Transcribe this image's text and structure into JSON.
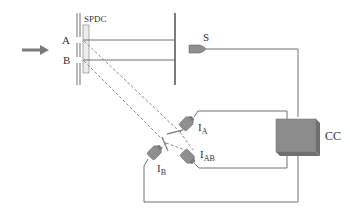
{
  "diagram": {
    "colors": {
      "line": "#707070",
      "barrier": "#8a8a8a",
      "crystal_fill": "#ececec",
      "detector_fill": "#8f8f8f",
      "cc_fill": "#8c8c8c",
      "cc_side": "#6e6e6e",
      "arrow": "#7a7a7a",
      "text": "#333333"
    },
    "labels": {
      "spdc": "SPDC",
      "path_a": "A",
      "path_b": "B",
      "detector_s": "S",
      "detector_ia_main": "I",
      "detector_ia_sub": "A",
      "detector_ib_main": "I",
      "detector_ib_sub": "B",
      "detector_iab_main": "I",
      "detector_iab_sub": "AB",
      "coincidence_counter": "CC"
    },
    "components": [
      {
        "id": "pump-arrow",
        "type": "arrow"
      },
      {
        "id": "double-slit-barrier",
        "type": "barrier",
        "slits": [
          "A",
          "B"
        ]
      },
      {
        "id": "spdc-crystal",
        "type": "crystal",
        "label": "SPDC"
      },
      {
        "id": "screen-wall",
        "type": "wall"
      },
      {
        "id": "detector-s",
        "type": "detector",
        "label": "S"
      },
      {
        "id": "beam-splitter-1",
        "type": "beam-splitter"
      },
      {
        "id": "beam-splitter-2",
        "type": "beam-splitter"
      },
      {
        "id": "detector-ia",
        "type": "detector",
        "label": "IA"
      },
      {
        "id": "detector-ib",
        "type": "detector",
        "label": "IB"
      },
      {
        "id": "detector-iab",
        "type": "detector",
        "label": "IAB"
      },
      {
        "id": "coincidence-counter",
        "type": "box",
        "label": "CC"
      }
    ]
  }
}
